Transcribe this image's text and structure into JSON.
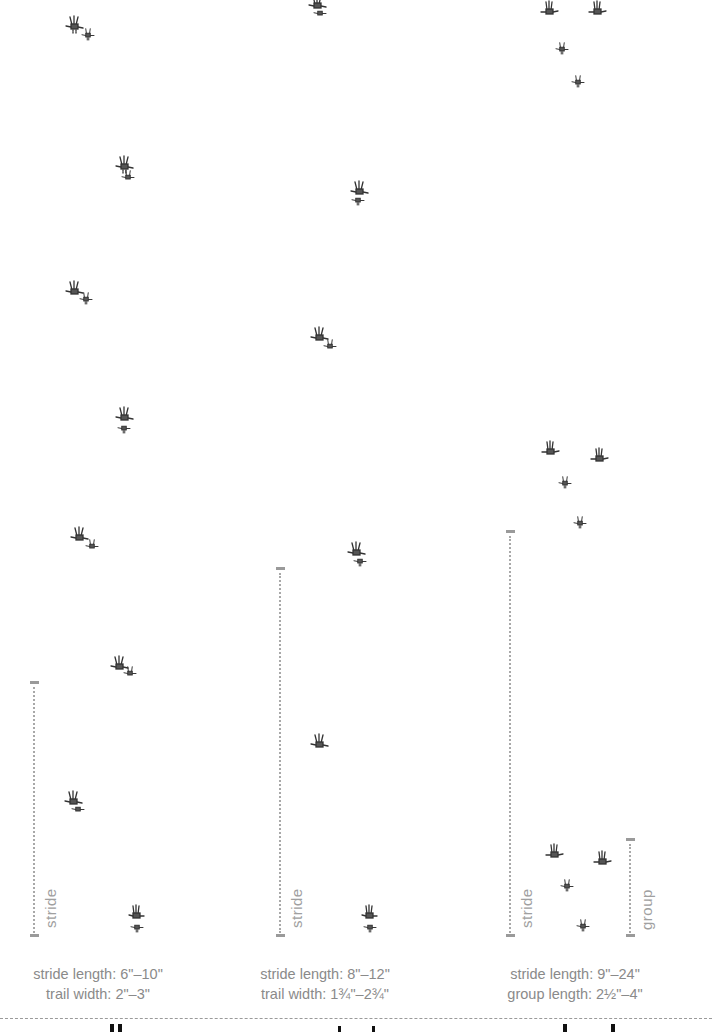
{
  "figure": {
    "columns": [
      {
        "id": "walk",
        "stride_label": "stride",
        "caption_line1": "stride length: 6\"–10\"",
        "caption_line2": "trail width: 2\"–3\"",
        "prints": [
          [
            75,
            25
          ],
          [
            125,
            168
          ],
          [
            78,
            293
          ],
          [
            125,
            420
          ],
          [
            85,
            540
          ],
          [
            125,
            668
          ],
          [
            75,
            803
          ],
          [
            137,
            918
          ]
        ]
      },
      {
        "id": "trot",
        "stride_label": "stride",
        "caption_line1": "stride length: 8\"–12\"",
        "caption_line2": "trail width: 1¾\"–2¾\"",
        "prints": [
          [
            318,
            8
          ],
          [
            360,
            193
          ],
          [
            322,
            340
          ],
          [
            358,
            555
          ],
          [
            320,
            745
          ],
          [
            370,
            920
          ]
        ]
      },
      {
        "id": "bound",
        "stride_label": "stride",
        "group_label": "group",
        "caption_line1": "stride length: 9\"–24\"",
        "caption_line2": "group length: 2½\"–4\"",
        "prints": [
          [
            548,
            12
          ],
          [
            597,
            12
          ],
          [
            562,
            48
          ],
          [
            578,
            82
          ],
          [
            550,
            450
          ],
          [
            600,
            457
          ],
          [
            565,
            482
          ],
          [
            580,
            522
          ],
          [
            555,
            853
          ],
          [
            603,
            860
          ],
          [
            567,
            885
          ],
          [
            583,
            925
          ]
        ]
      }
    ]
  },
  "colors": {
    "print": "#333333",
    "measure": "#a8a8a8",
    "caption": "#8a8a8a"
  }
}
